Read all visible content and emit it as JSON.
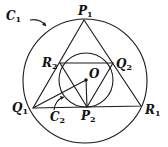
{
  "diagram": {
    "stroke_color": "#1a1a1a",
    "background": "#ffffff",
    "outer_circle": {
      "label": "C",
      "sub": "1",
      "cx": 85,
      "cy": 81,
      "r": 62
    },
    "inner_circle": {
      "label": "C",
      "sub": "2",
      "cx": 86,
      "cy": 80,
      "r": 27
    },
    "center": {
      "label": "O",
      "x": 86,
      "y": 80
    },
    "points": {
      "P1": {
        "label": "P",
        "sub": "1",
        "x": 84,
        "y": 20
      },
      "Q1": {
        "label": "Q",
        "sub": "1",
        "x": 33,
        "y": 108
      },
      "R1": {
        "label": "R",
        "sub": "1",
        "x": 141,
        "y": 106
      },
      "P2": {
        "label": "P",
        "sub": "2",
        "x": 87,
        "y": 107
      },
      "Q2": {
        "label": "Q",
        "sub": "2",
        "x": 113,
        "y": 63
      },
      "R2": {
        "label": "R",
        "sub": "2",
        "x": 60,
        "y": 63
      }
    }
  }
}
